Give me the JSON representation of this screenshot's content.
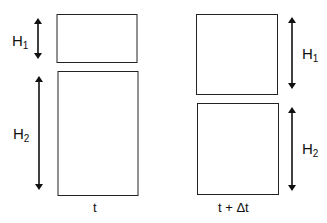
{
  "diagram": {
    "left_panel": {
      "caption": "t",
      "top_label": {
        "base": "H",
        "sub": "1"
      },
      "bottom_label": {
        "base": "H",
        "sub": "2"
      }
    },
    "right_panel": {
      "caption": "t + Δt",
      "top_label": {
        "base": "H",
        "sub": "1"
      },
      "bottom_label": {
        "base": "H",
        "sub": "2"
      }
    }
  }
}
